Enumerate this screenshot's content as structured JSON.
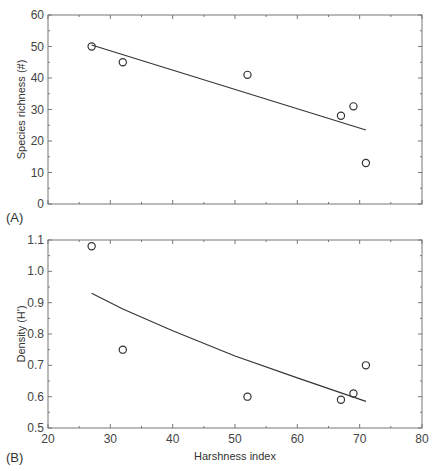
{
  "chart_data": [
    {
      "type": "scatter",
      "panel_label": "(A)",
      "xlabel": "",
      "ylabel": "Species richness (#)",
      "xlim": [
        20,
        80
      ],
      "ylim": [
        0,
        60
      ],
      "xticks": [
        20,
        30,
        40,
        50,
        60,
        70,
        80
      ],
      "yticks": [
        0,
        10,
        20,
        30,
        40,
        50,
        60
      ],
      "ytick_labels": [
        "0",
        "10",
        "20",
        "30",
        "40",
        "50",
        "60"
      ],
      "series": [
        {
          "name": "observed",
          "marker": "open-circle",
          "x": [
            27,
            32,
            52,
            67,
            69,
            71
          ],
          "y": [
            50,
            45,
            41,
            28,
            31,
            13
          ]
        },
        {
          "name": "linear fit",
          "style": "line",
          "x": [
            27,
            71
          ],
          "y": [
            50.5,
            23.5
          ]
        }
      ]
    },
    {
      "type": "scatter",
      "panel_label": "(B)",
      "xlabel": "Harshness index",
      "ylabel": "Density (H')",
      "xlim": [
        20,
        80
      ],
      "ylim": [
        0.5,
        1.1
      ],
      "xticks": [
        20,
        30,
        40,
        50,
        60,
        70,
        80
      ],
      "xtick_labels": [
        "20",
        "30",
        "40",
        "50",
        "60",
        "70",
        "80"
      ],
      "yticks": [
        0.5,
        0.6,
        0.7,
        0.8,
        0.9,
        1.0,
        1.1
      ],
      "ytick_labels": [
        "0.5",
        "0.6",
        "0.7",
        "0.8",
        "0.9",
        "1.0",
        "1.1"
      ],
      "series": [
        {
          "name": "observed",
          "marker": "open-circle",
          "x": [
            27,
            32,
            52,
            67,
            69,
            71
          ],
          "y": [
            1.08,
            0.75,
            0.6,
            0.59,
            0.61,
            0.7
          ]
        },
        {
          "name": "fitted curve",
          "style": "line",
          "x": [
            27,
            32,
            40,
            50,
            60,
            71
          ],
          "y": [
            0.93,
            0.88,
            0.81,
            0.73,
            0.66,
            0.585
          ]
        }
      ]
    }
  ]
}
